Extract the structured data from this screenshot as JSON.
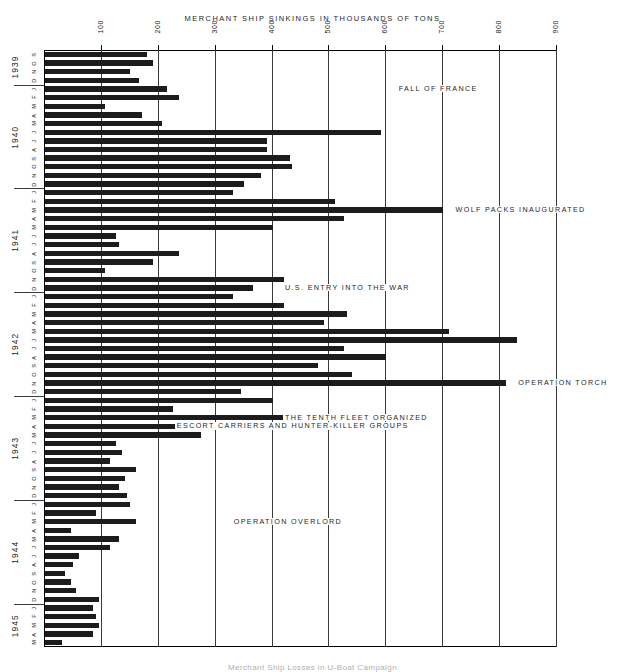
{
  "chart_data": {
    "type": "bar",
    "orientation": "horizontal",
    "title": "MERCHANT SHIP SINKINGS IN THOUSANDS OF TONS",
    "xlabel": "",
    "ylabel": "",
    "xlim": [
      0,
      900
    ],
    "xticks": [
      100,
      200,
      300,
      400,
      500,
      600,
      700,
      800,
      900
    ],
    "xtick_labels": [
      "100",
      "200",
      "300",
      "400",
      "500",
      "600",
      "700",
      "800",
      "900"
    ],
    "grid": true,
    "legend": "none",
    "bar_color": "#1c1c1c",
    "categories": [
      "1939-S",
      "1939-O",
      "1939-N",
      "1939-D",
      "1940-J",
      "1940-F",
      "1940-M",
      "1940-A",
      "1940-M",
      "1940-J",
      "1940-J",
      "1940-A",
      "1940-S",
      "1940-O",
      "1940-N",
      "1940-D",
      "1941-J",
      "1941-F",
      "1941-M",
      "1941-A",
      "1941-M",
      "1941-J",
      "1941-J",
      "1941-A",
      "1941-S",
      "1941-O",
      "1941-N",
      "1941-D",
      "1942-J",
      "1942-F",
      "1942-M",
      "1942-A",
      "1942-M",
      "1942-J",
      "1942-J",
      "1942-A",
      "1942-S",
      "1942-O",
      "1942-N",
      "1942-D",
      "1943-J",
      "1943-F",
      "1943-M",
      "1943-A",
      "1943-M",
      "1943-J",
      "1943-J",
      "1943-A",
      "1943-S",
      "1943-O",
      "1943-N",
      "1943-D",
      "1944-J",
      "1944-F",
      "1944-M",
      "1944-A",
      "1944-M",
      "1944-J",
      "1944-J",
      "1944-A",
      "1944-S",
      "1944-O",
      "1944-N",
      "1944-D",
      "1945-J",
      "1945-F",
      "1945-M",
      "1945-A",
      "1945-M"
    ],
    "values": [
      180,
      190,
      150,
      165,
      215,
      235,
      105,
      170,
      205,
      590,
      390,
      390,
      430,
      435,
      380,
      350,
      330,
      510,
      700,
      525,
      400,
      125,
      130,
      235,
      190,
      105,
      420,
      365,
      330,
      420,
      530,
      490,
      710,
      830,
      525,
      600,
      480,
      540,
      810,
      345,
      400,
      225,
      640,
      310,
      275,
      125,
      135,
      115,
      160,
      140,
      130,
      145,
      150,
      90,
      160,
      45,
      130,
      115,
      60,
      50,
      35,
      45,
      55,
      95,
      85,
      90,
      95,
      85,
      30
    ],
    "year_groups": [
      {
        "year": "1939",
        "months": [
          "S",
          "O",
          "N",
          "D"
        ]
      },
      {
        "year": "1940",
        "months": [
          "J",
          "F",
          "M",
          "A",
          "M",
          "J",
          "J",
          "A",
          "S",
          "O",
          "N",
          "D"
        ]
      },
      {
        "year": "1941",
        "months": [
          "J",
          "F",
          "M",
          "A",
          "M",
          "J",
          "J",
          "A",
          "S",
          "O",
          "N",
          "D"
        ]
      },
      {
        "year": "1942",
        "months": [
          "J",
          "F",
          "M",
          "A",
          "M",
          "J",
          "J",
          "A",
          "S",
          "O",
          "N",
          "D"
        ]
      },
      {
        "year": "1943",
        "months": [
          "J",
          "F",
          "M",
          "A",
          "M",
          "J",
          "J",
          "A",
          "S",
          "O",
          "N",
          "D"
        ]
      },
      {
        "year": "1944",
        "months": [
          "J",
          "F",
          "M",
          "A",
          "M",
          "J",
          "J",
          "A",
          "S",
          "O",
          "N",
          "D"
        ]
      },
      {
        "year": "1945",
        "months": [
          "J",
          "F",
          "M",
          "A",
          "M"
        ]
      }
    ],
    "annotations": [
      {
        "text": "FALL OF FRANCE",
        "category": "1940-J",
        "x_value": 620
      },
      {
        "text": "WOLF PACKS INAUGURATED",
        "category": "1941-M",
        "x_value": 720
      },
      {
        "text": "U.S. ENTRY INTO THE WAR",
        "category": "1941-D",
        "x_value": 420
      },
      {
        "text": "OPERATION TORCH",
        "category": "1942-N",
        "x_value": 830
      },
      {
        "text": "THE TENTH FLEET ORGANIZED",
        "category": "1943-M",
        "x_value": 420
      },
      {
        "text": "ESCORT CARRIERS AND HUNTER-KILLER GROUPS",
        "category": "1943-A",
        "x_value": 230
      },
      {
        "text": "OPERATION OVERLORD",
        "category": "1944-M",
        "x_value": 330
      }
    ]
  },
  "caption": {
    "text": "Merchant Ship Losses in U-Boat Campaign"
  }
}
